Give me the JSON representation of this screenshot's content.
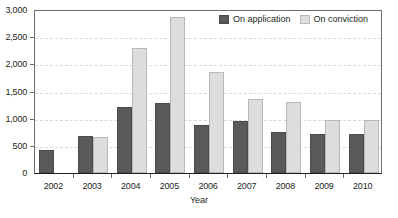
{
  "chart_data": {
    "type": "bar",
    "title": "",
    "xlabel": "Year",
    "ylabel": "",
    "categories": [
      "2002",
      "2003",
      "2004",
      "2005",
      "2006",
      "2007",
      "2008",
      "2009",
      "2010"
    ],
    "series": [
      {
        "name": "On application",
        "color": "#58595b",
        "values": [
          420,
          680,
          1220,
          1280,
          880,
          950,
          760,
          710,
          710
        ]
      },
      {
        "name": "On conviction",
        "color": "#dcdddf",
        "values": [
          0,
          660,
          2300,
          2870,
          1850,
          1370,
          1300,
          980,
          970
        ]
      }
    ],
    "ylim": [
      0,
      3000
    ],
    "y_ticks": [
      0,
      500,
      1000,
      1500,
      2000,
      2500,
      3000
    ],
    "y_tick_labels": [
      "0",
      "500",
      "1,000",
      "1,500",
      "2,000",
      "2,500",
      "3,000"
    ],
    "grid": true,
    "legend_position": "top-right"
  },
  "legend": {
    "items": [
      {
        "label": "On application",
        "swatch": "app"
      },
      {
        "label": "On conviction",
        "swatch": "conv"
      }
    ]
  },
  "axis": {
    "x_title": "Year"
  }
}
